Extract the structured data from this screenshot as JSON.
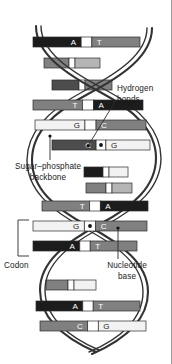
{
  "figure": {
    "background_color": "#ffffff",
    "ink_color": "#1a1a1a",
    "border_color": "#9a9a9a"
  },
  "annotations": [
    {
      "id": "hydrogen-bonds",
      "line1": "Hydrogen",
      "line2": "bonds",
      "x": 117,
      "y": 84
    },
    {
      "id": "sugar-phosphate",
      "line1": "Sugar–phosphate",
      "line2": "backbone",
      "x": 6,
      "y": 162
    },
    {
      "id": "codon",
      "line1": "Codon",
      "line2": "",
      "x": 4,
      "y": 261
    },
    {
      "id": "nucleotide-base",
      "line1": "Nucleotide",
      "line2": "base",
      "x": 93,
      "y": 261
    }
  ],
  "palette": {
    "base_dark": "#1c1c1c",
    "base_mid_dark": "#4d4d4d",
    "base_mid": "#808080",
    "base_light": "#b5b5b5",
    "base_white": "#f2f2f2",
    "backbone_fill": "#ffffff",
    "backbone_stroke": "#333333",
    "rung_stroke": "#2b2b2b"
  },
  "base_pairs": [
    {
      "index": 0,
      "y": 42,
      "left_letter": "A",
      "right_letter": "T",
      "left_fill": "#1c1c1c",
      "right_fill": "#808080",
      "left_text": "#ffffff",
      "right_text": "#ffffff",
      "x_start": 33,
      "x_end": 140,
      "visible": true,
      "dot": false
    },
    {
      "index": 1,
      "y": 63,
      "left_letter": "",
      "right_letter": "",
      "left_fill": "#808080",
      "right_fill": "#b5b5b5",
      "left_text": "#ffffff",
      "right_text": "#1a1a1a",
      "x_start": 44,
      "x_end": 100,
      "visible": false,
      "dot": false
    },
    {
      "index": 2,
      "y": 85,
      "left_letter": "",
      "right_letter": "",
      "left_fill": "#4d4d4d",
      "right_fill": "#808080",
      "left_text": "#ffffff",
      "right_text": "#ffffff",
      "x_start": 52,
      "x_end": 112,
      "visible": false,
      "dot": false
    },
    {
      "index": 3,
      "y": 105,
      "left_letter": "T",
      "right_letter": "A",
      "left_fill": "#808080",
      "right_fill": "#1c1c1c",
      "left_text": "#ffffff",
      "right_text": "#ffffff",
      "x_start": 33,
      "x_end": 143,
      "visible": true,
      "dot": false
    },
    {
      "index": 4,
      "y": 125,
      "left_letter": "G",
      "right_letter": "C",
      "left_fill": "#f2f2f2",
      "right_fill": "#808080",
      "left_text": "#1a1a1a",
      "right_text": "#ffffff",
      "x_start": 35,
      "x_end": 146,
      "visible": true,
      "dot": false
    },
    {
      "index": 5,
      "y": 145,
      "left_letter": "C",
      "right_letter": "G",
      "left_fill": "#4d4d4d",
      "right_fill": "#f2f2f2",
      "left_text": "#ffffff",
      "right_text": "#1a1a1a",
      "x_start": 52,
      "x_end": 150,
      "visible": true,
      "dot": true
    },
    {
      "index": 6,
      "y": 172,
      "left_letter": "",
      "right_letter": "",
      "left_fill": "#1c1c1c",
      "right_fill": "#f2f2f2",
      "left_text": "#ffffff",
      "right_text": "#1a1a1a",
      "x_start": 84,
      "x_end": 128,
      "visible": false,
      "dot": false
    },
    {
      "index": 7,
      "y": 188,
      "left_letter": "",
      "right_letter": "",
      "left_fill": "#808080",
      "right_fill": "#b5b5b5",
      "left_text": "#ffffff",
      "right_text": "#1a1a1a",
      "x_start": 86,
      "x_end": 132,
      "visible": false,
      "dot": false
    },
    {
      "index": 8,
      "y": 206,
      "left_letter": "T",
      "right_letter": "A",
      "left_fill": "#808080",
      "right_fill": "#1c1c1c",
      "left_text": "#ffffff",
      "right_text": "#ffffff",
      "x_start": 42,
      "x_end": 148,
      "visible": true,
      "dot": false
    },
    {
      "index": 9,
      "y": 226,
      "left_letter": "G",
      "right_letter": "C",
      "left_fill": "#f2f2f2",
      "right_fill": "#808080",
      "left_text": "#1a1a1a",
      "right_text": "#ffffff",
      "x_start": 33,
      "x_end": 147,
      "visible": true,
      "dot": true
    },
    {
      "index": 10,
      "y": 246,
      "left_letter": "A",
      "right_letter": "T",
      "left_fill": "#1c1c1c",
      "right_fill": "#808080",
      "left_text": "#ffffff",
      "right_text": "#ffffff",
      "x_start": 33,
      "x_end": 137,
      "visible": true,
      "dot": false
    },
    {
      "index": 11,
      "y": 285,
      "left_letter": "",
      "right_letter": "",
      "left_fill": "#808080",
      "right_fill": "#f2f2f2",
      "left_text": "#ffffff",
      "right_text": "#1a1a1a",
      "x_start": 46,
      "x_end": 96,
      "visible": false,
      "dot": false
    },
    {
      "index": 12,
      "y": 306,
      "left_letter": "A",
      "right_letter": "T",
      "left_fill": "#1c1c1c",
      "right_fill": "#808080",
      "left_text": "#ffffff",
      "right_text": "#ffffff",
      "x_start": 36,
      "x_end": 140,
      "visible": true,
      "dot": false
    },
    {
      "index": 13,
      "y": 326,
      "left_letter": "C",
      "right_letter": "G",
      "left_fill": "#808080",
      "right_fill": "#f2f2f2",
      "left_text": "#ffffff",
      "right_text": "#1a1a1a",
      "x_start": 40,
      "x_end": 146,
      "visible": true,
      "dot": false
    }
  ],
  "codon_bracket": {
    "x": 18,
    "y_top": 220,
    "y_bottom": 256,
    "tick_length": 11
  },
  "leader_lines": [
    {
      "id": "hydrogen-bonds-leader",
      "x1": 116,
      "y1": 100,
      "x2": 88,
      "y2": 146
    },
    {
      "id": "sugar-phosphate-leader",
      "x1": 50,
      "y1": 160,
      "x2": 50,
      "y2": 136
    },
    {
      "id": "nucleotide-base-leader",
      "x1": 118,
      "y1": 259,
      "x2": 118,
      "y2": 228
    }
  ]
}
